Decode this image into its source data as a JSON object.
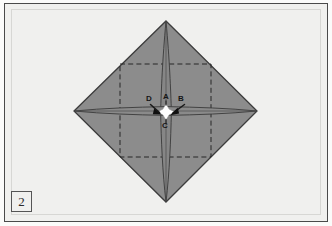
{
  "figure": {
    "kind": "origami-fold-diagram",
    "step_number": "2",
    "background_color": "#f0f0ee",
    "frame_color": "#4a4a4a",
    "paper_fill": "#8c8c8c",
    "paper_edge_color": "#3c3c3c",
    "crease_dashed_color": "#2e2e2e",
    "highlight_color": "#ffffff"
  },
  "labels": {
    "a": "A",
    "b": "B",
    "c": "C",
    "d": "D"
  },
  "geometry": {
    "diamond": {
      "top": [
        166,
        21
      ],
      "right": [
        257,
        111
      ],
      "bottom": [
        166,
        202
      ],
      "left": [
        74,
        111
      ]
    },
    "dashed_square": {
      "left": 120,
      "top": 64,
      "right": 211,
      "bottom": 157
    },
    "center": [
      166,
      112
    ]
  }
}
